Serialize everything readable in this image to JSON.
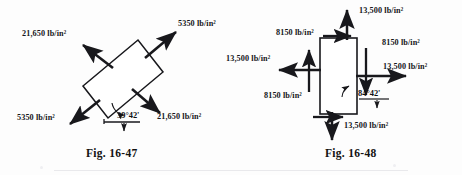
{
  "page": {
    "background_color": "#fdfdfd",
    "ink_color": "#16161a"
  },
  "figures": [
    {
      "id": "fig-16-47",
      "caption": "Fig. 16-47",
      "element": {
        "shape": "rectangle",
        "rotation_deg": -39.7,
        "description": "inclined rectangular stress element"
      },
      "angle_label": "39°42'",
      "stresses": [
        {
          "name": "upper-left-stress",
          "value": "21,650",
          "unit": "lb/in²",
          "label": "21,650 lb/in²",
          "direction": "up-left",
          "sense": "tension"
        },
        {
          "name": "upper-right-stress",
          "value": "5350",
          "unit": "lb/in²",
          "label": "5350 lb/in²",
          "direction": "up-right",
          "sense": "tension"
        },
        {
          "name": "lower-left-stress",
          "value": "5350",
          "unit": "lb/in²",
          "label": "5350 lb/in²",
          "direction": "down-left",
          "sense": "tension"
        },
        {
          "name": "lower-right-stress",
          "value": "21,650",
          "unit": "lb/in²",
          "label": "21,650 lb/in²",
          "direction": "down-right",
          "sense": "tension"
        }
      ]
    },
    {
      "id": "fig-16-48",
      "caption": "Fig. 16-48",
      "element": {
        "shape": "rectangle",
        "rotation_deg": 0,
        "description": "upright rectangular stress element with normal and shear arrows"
      },
      "angle_label": "84°42'",
      "stresses": [
        {
          "name": "top-normal-stress",
          "value": "13,500",
          "unit": "lb/in²",
          "label": "13,500 lb/in²",
          "direction": "up",
          "sense": "tension"
        },
        {
          "name": "bottom-normal-stress",
          "value": "13,500",
          "unit": "lb/in²",
          "label": "13,500 lb/in²",
          "direction": "down",
          "sense": "tension"
        },
        {
          "name": "left-normal-stress",
          "value": "13,500",
          "unit": "lb/in²",
          "label": "13,500 lb/in²",
          "direction": "left",
          "sense": "tension"
        },
        {
          "name": "right-normal-stress",
          "value": "13,500",
          "unit": "lb/in²",
          "label": "13,500 lb/in²",
          "direction": "right",
          "sense": "tension"
        },
        {
          "name": "top-shear-stress",
          "value": "8150",
          "unit": "lb/in²",
          "label": "8150 lb/in²",
          "direction": "right",
          "sense": "shear"
        },
        {
          "name": "bottom-shear-stress",
          "value": "8150",
          "unit": "lb/in²",
          "label": "8150 lb/in²",
          "direction": "right",
          "sense": "shear"
        },
        {
          "name": "left-shear-stress",
          "value": "8150",
          "unit": "lb/in²",
          "label": "8150 lb/in²",
          "direction": "up",
          "sense": "shear"
        },
        {
          "name": "right-shear-stress",
          "value": "8150",
          "unit": "lb/in²",
          "label": "8150 lb/in²",
          "direction": "down",
          "sense": "shear"
        }
      ]
    }
  ]
}
